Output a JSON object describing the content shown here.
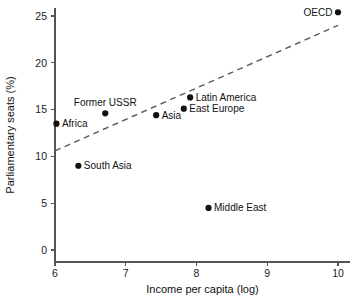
{
  "chart_data": {
    "type": "scatter",
    "title": "",
    "xlabel": "Income per capita (log)",
    "ylabel": "Parliamentary seats (%)",
    "xlim": [
      5.8,
      10.15
    ],
    "ylim": [
      -0.8,
      26.6
    ],
    "xticks": [
      "6",
      "7",
      "8",
      "9",
      "10"
    ],
    "xtick_values": [
      6,
      7,
      8,
      9,
      10
    ],
    "yticks": [
      "0",
      "5",
      "10",
      "15",
      "20",
      "25"
    ],
    "ytick_values": [
      0,
      5,
      10,
      15,
      20,
      25
    ],
    "grid": false,
    "legend": "none",
    "marker_color": "#111111",
    "axis_color": "#555555",
    "trend_color": "#5a5a5a",
    "points": [
      {
        "label": "Africa",
        "x": 6.02,
        "y": 13.5,
        "label_pos": "right"
      },
      {
        "label": "South Asia",
        "x": 6.33,
        "y": 9.0,
        "label_pos": "right"
      },
      {
        "label": "Former USSR",
        "x": 6.71,
        "y": 14.6,
        "label_pos": "above"
      },
      {
        "label": "Asia",
        "x": 7.43,
        "y": 14.4,
        "label_pos": "right"
      },
      {
        "label": "East Europe",
        "x": 7.82,
        "y": 15.1,
        "label_pos": "right"
      },
      {
        "label": "Latin America",
        "x": 7.91,
        "y": 16.3,
        "label_pos": "right"
      },
      {
        "label": "Middle East",
        "x": 8.17,
        "y": 4.5,
        "label_pos": "right"
      },
      {
        "label": "OECD",
        "x": 10.0,
        "y": 25.4,
        "label_pos": "left"
      }
    ],
    "trend": {
      "style": "dashed",
      "x_start": 6.0,
      "y_start": 10.6,
      "x_end": 10.0,
      "y_end": 24.0
    }
  }
}
